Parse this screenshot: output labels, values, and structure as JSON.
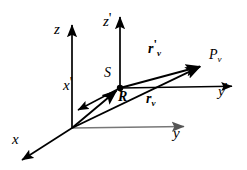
{
  "figure": {
    "background_color": "#ffffff",
    "line_color": "#000000",
    "secondary_line_color": "#808080"
  },
  "axes": [
    {
      "id": "z",
      "label": "z",
      "prime": "",
      "frame": "unprimed",
      "direction": "up",
      "origin_px": [
        72,
        128
      ],
      "tip_px": [
        72,
        20
      ]
    },
    {
      "id": "y",
      "label": "y",
      "prime": "",
      "frame": "unprimed",
      "direction": "right",
      "origin_px": [
        72,
        128
      ],
      "tip_px": [
        190,
        126
      ]
    },
    {
      "id": "x",
      "label": "x",
      "prime": "",
      "frame": "unprimed",
      "direction": "down-left",
      "origin_px": [
        72,
        128
      ],
      "tip_px": [
        18,
        163
      ]
    },
    {
      "id": "zprime",
      "label": "z",
      "prime": "'",
      "frame": "primed",
      "direction": "up",
      "origin_px": [
        120,
        88
      ],
      "tip_px": [
        120,
        12
      ]
    },
    {
      "id": "yprime",
      "label": "y",
      "prime": "'",
      "frame": "primed",
      "direction": "right",
      "origin_px": [
        120,
        88
      ],
      "tip_px": [
        237,
        86
      ]
    },
    {
      "id": "xprime",
      "label": "x",
      "prime": "'",
      "frame": "primed",
      "direction": "down-left",
      "origin_px": [
        120,
        88
      ],
      "tip_px": [
        75,
        112
      ]
    }
  ],
  "points": [
    {
      "id": "origin",
      "label": "",
      "sub": "",
      "px": [
        72,
        128
      ],
      "marked": false
    },
    {
      "id": "S",
      "label": "S",
      "sub": "",
      "px": [
        120,
        88
      ],
      "marked": true
    },
    {
      "id": "Pv",
      "label": "P",
      "sub": "v",
      "px": [
        205,
        65
      ],
      "marked": false
    }
  ],
  "vectors": [
    {
      "id": "R",
      "label": "R",
      "prime": "",
      "sub": "",
      "from": "origin",
      "to": "S",
      "from_px": [
        72,
        128
      ],
      "to_px": [
        120,
        88
      ]
    },
    {
      "id": "rv",
      "label": "r",
      "prime": "",
      "sub": "v",
      "from": "origin",
      "to": "Pv",
      "from_px": [
        72,
        128
      ],
      "to_px": [
        205,
        65
      ]
    },
    {
      "id": "rvprime",
      "label": "r",
      "prime": "'",
      "sub": "v",
      "from": "S",
      "to": "Pv",
      "from_px": [
        120,
        88
      ],
      "to_px": [
        205,
        65
      ]
    }
  ],
  "labels": {
    "z": {
      "text": "z",
      "prime": "",
      "x": 54,
      "y": 29
    },
    "zprime": {
      "text": "z",
      "prime": "'",
      "x": 103,
      "y": 21
    },
    "y": {
      "text": "y",
      "prime": "",
      "x": 173,
      "y": 131
    },
    "yprime": {
      "text": "y",
      "prime": "'",
      "x": 218,
      "y": 90
    },
    "x": {
      "text": "x",
      "prime": "",
      "x": 12,
      "y": 138
    },
    "xprime": {
      "text": "x",
      "prime": "'",
      "x": 63,
      "y": 84
    },
    "S": {
      "text": "S",
      "sub": "",
      "x": 104,
      "y": 72
    },
    "R": {
      "text": "R",
      "sub": "",
      "x": 118,
      "y": 95
    },
    "Pv": {
      "text": "P",
      "sub": "v",
      "x": 209,
      "y": 54
    },
    "rv": {
      "text": "r",
      "prime": "",
      "sub": "v",
      "x": 146,
      "y": 97
    },
    "rvprime": {
      "text": "r",
      "prime": "'",
      "sub": "v",
      "x": 148,
      "y": 48
    }
  }
}
